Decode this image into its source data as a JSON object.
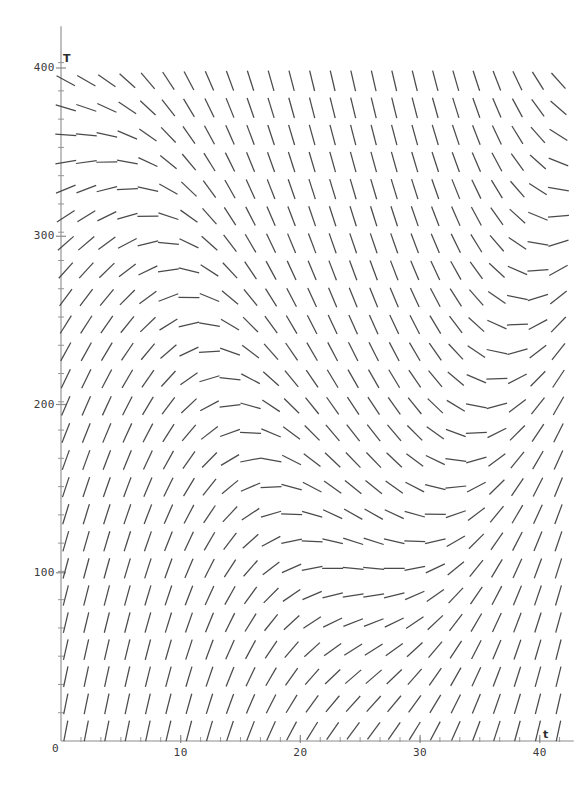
{
  "figure": {
    "kind": "slope-field",
    "background_color": "#ffffff",
    "segment_color": "#4a4a4a",
    "axis_color": "#8c8c8c",
    "label_color": "#3a3a3a",
    "width": 587,
    "height": 806
  },
  "axes": {
    "x_axis_name": "t",
    "y_axis_name": "T",
    "origin_label": "0",
    "x_ticks": [
      {
        "value": 10,
        "label": "10"
      },
      {
        "value": 20,
        "label": "20"
      },
      {
        "value": 30,
        "label": "30"
      },
      {
        "value": 40,
        "label": "40"
      }
    ],
    "y_ticks": [
      {
        "value": 100,
        "label": "100"
      },
      {
        "value": 200,
        "label": "200"
      },
      {
        "value": 300,
        "label": "300"
      },
      {
        "value": 400,
        "label": "400"
      }
    ]
  },
  "chart_data": {
    "type": "scatter",
    "title": "",
    "xlabel": "t",
    "ylabel": "T",
    "xlim": [
      0,
      42.5
    ],
    "ylim": [
      0,
      420
    ],
    "grid": false,
    "legend": null,
    "x_tick_values": [
      10,
      20,
      30,
      40
    ],
    "y_tick_values": [
      100,
      200,
      300,
      400
    ],
    "x_tick_labels": [
      "10",
      "20",
      "30",
      "40"
    ],
    "y_tick_labels": [
      "100",
      "200",
      "300",
      "400"
    ],
    "minor_tick_step_x": 1.666,
    "minor_tick_step_y": 16.8,
    "field": {
      "description": "Direction field of dT/dt = k*(N(t) - T) with oscillating/curved nullcline; slope segments drawn on a regular grid",
      "grid_columns": 25,
      "grid_rows": 26,
      "x_start": 0.4,
      "x_step": 1.715,
      "y_start": 6,
      "y_step": 16.1,
      "segment_pixel_length": 21,
      "model": {
        "form": "dT/dt = k * (C(t) - T)",
        "k": 0.105,
        "carrying_curve": {
          "form": "C(t) = base + amp * cos(2*pi*(t - phase)/period) + trend*t",
          "base": 205,
          "amp": 150,
          "phase": 0,
          "period": 52,
          "trend": 1.6
        },
        "slope_display_scale": 1.0
      }
    }
  }
}
